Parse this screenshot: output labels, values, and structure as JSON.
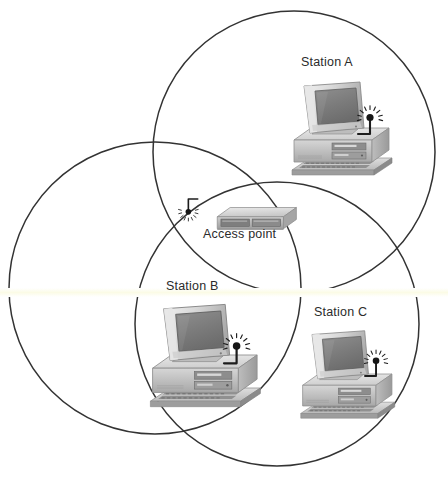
{
  "diagram": {
    "background_color": "#ffffff",
    "stroke_color": "#333333",
    "label_color": "#2b2b2b",
    "artifact_color": "#fbfbe6"
  },
  "coverage_areas": [
    {
      "name": "coverage-circle-top",
      "cx": 294,
      "cy": 152,
      "r": 141,
      "stroke": "#333333"
    },
    {
      "name": "coverage-circle-left",
      "cx": 155,
      "cy": 288,
      "r": 146,
      "stroke": "#333333"
    },
    {
      "name": "coverage-circle-bottom-right",
      "cx": 277,
      "cy": 324,
      "r": 142,
      "stroke": "#333333"
    }
  ],
  "nodes": [
    {
      "id": "station-a",
      "label": "Station A",
      "type": "workstation",
      "label_x": 301,
      "label_y": 62,
      "device_x": 288,
      "device_y": 78,
      "device_scale": 1.0,
      "antenna": "wireless-antenna-icon"
    },
    {
      "id": "access-point",
      "label": "Access point",
      "type": "access-point",
      "label_x": 203,
      "label_y": 231,
      "device_x": 185,
      "device_y": 198,
      "device_scale": 1.0,
      "antenna": "wireless-antenna-icon"
    },
    {
      "id": "station-b",
      "label": "Station B",
      "type": "workstation",
      "label_x": 166,
      "label_y": 285,
      "device_x": 146,
      "device_y": 300,
      "device_scale": 1.12,
      "antenna": "wireless-antenna-icon"
    },
    {
      "id": "station-c",
      "label": "Station C",
      "type": "workstation",
      "label_x": 314,
      "label_y": 310,
      "device_x": 297,
      "device_y": 327,
      "device_scale": 0.95,
      "antenna": "wireless-antenna-icon"
    }
  ]
}
